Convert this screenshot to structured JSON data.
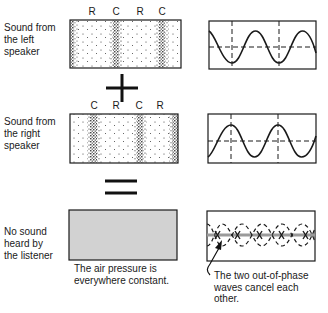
{
  "rows": [
    {
      "label": "Sound from the left speaker",
      "label_lines": [
        "Sound from",
        "the left",
        "speaker"
      ],
      "markers": [
        "R",
        "C",
        "R",
        "C"
      ]
    },
    {
      "label": "Sound from the right speaker",
      "label_lines": [
        "Sound from",
        "the right",
        "speaker"
      ],
      "markers": [
        "C",
        "R",
        "C",
        "R"
      ]
    },
    {
      "label": "No sound heard by the listener",
      "label_lines": [
        "No sound",
        "heard by",
        "the listener"
      ]
    }
  ],
  "operators": {
    "plus": "+",
    "equals": "="
  },
  "captions": {
    "pressure_lines": [
      "The air pressure is",
      "everywhere constant."
    ],
    "cancel_lines": [
      "The two out-of-phase",
      "waves cancel each",
      "other."
    ]
  },
  "colors": {
    "ink": "#1a1a1a",
    "gray_fill": "#d2d2d2",
    "gray_line": "#9a9a9a"
  }
}
